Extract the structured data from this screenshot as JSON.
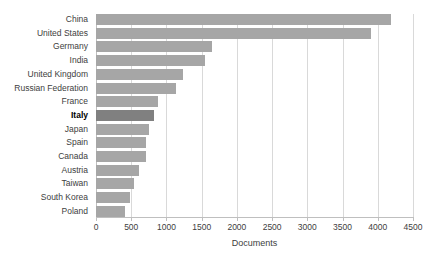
{
  "chart_data": {
    "type": "bar",
    "orientation": "horizontal",
    "title": "",
    "xlabel": "Documents",
    "ylabel": "",
    "xlim": [
      0,
      4500
    ],
    "xticks": [
      0,
      500,
      1000,
      1500,
      2000,
      2500,
      3000,
      3500,
      4000,
      4500
    ],
    "xtick_labels": [
      "0",
      "500",
      "1000",
      "1500",
      "2000",
      "2500",
      "3000",
      "3500",
      "4000",
      "4500"
    ],
    "grid": "vertical",
    "legend": "none",
    "categories": [
      "China",
      "United States",
      "Germany",
      "India",
      "United Kingdom",
      "Russian Federation",
      "France",
      "Italy",
      "Japan",
      "Spain",
      "Canada",
      "Austria",
      "Taiwan",
      "South Korea",
      "Poland"
    ],
    "values": [
      4190,
      3910,
      1640,
      1550,
      1230,
      1140,
      880,
      830,
      750,
      710,
      710,
      610,
      540,
      480,
      410
    ],
    "highlight_category": "Italy",
    "colors": {
      "bar": "#a6a6a6",
      "bar_highlight": "#808080",
      "gridline": "#d9d9d9",
      "axis": "#bfbfbf",
      "text": "#404040",
      "background": "#ffffff"
    }
  }
}
